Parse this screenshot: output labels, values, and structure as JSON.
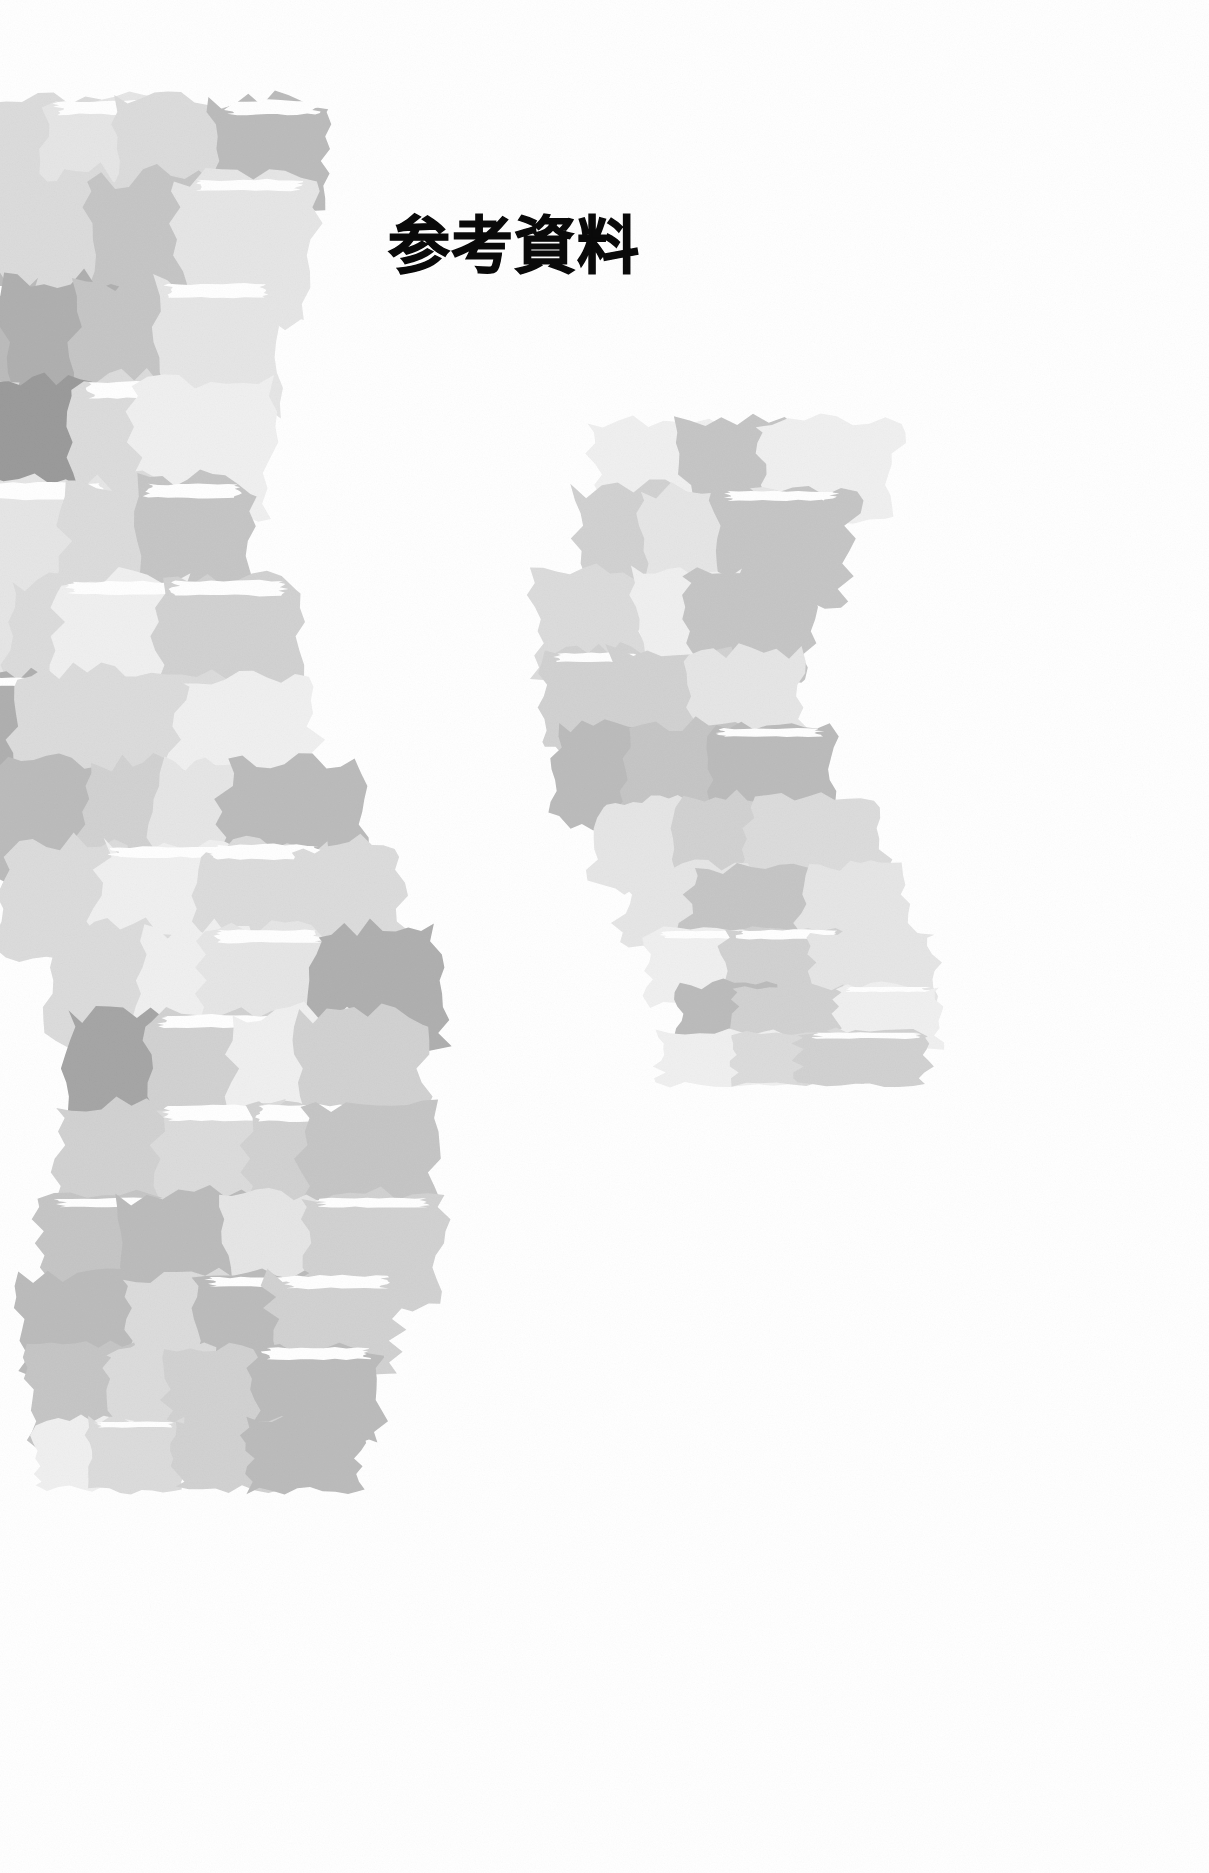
{
  "page": {
    "background_color": "#ffffff",
    "width": 1209,
    "height": 1873,
    "kind": "section-divider-page"
  },
  "title": {
    "text": "参考資料",
    "translation_hint": "Reference Materials",
    "color": "#0a0a0a",
    "weight": "bold",
    "x": 388,
    "y": 216
  },
  "artwork": {
    "name": "torn-paper-collage-ribbons",
    "description": "Two sinuous S-curved ribbons built from overlapping torn paper fragments in neutral grays on a white ground.",
    "palette": [
      "#9b9b9b",
      "#a6a6a6",
      "#b0b0b0",
      "#bcbcbc",
      "#c6c6c6",
      "#d2d2d2",
      "#dcdcdc",
      "#e6e6e6",
      "#f0f0f0",
      "#ffffff"
    ],
    "ribbons": [
      {
        "id": "ribbon-left",
        "label": "large-left-ribbon",
        "bbox": [
          60,
          112,
          500,
          1392
        ],
        "columns": 4,
        "rows": 16,
        "spine": [
          [
            150,
            115
          ],
          [
            110,
            300
          ],
          [
            80,
            500
          ],
          [
            110,
            690
          ],
          [
            190,
            860
          ],
          [
            250,
            1030
          ],
          [
            250,
            1210
          ],
          [
            200,
            1360
          ],
          [
            185,
            1480
          ]
        ],
        "width_profile": [
          330,
          320,
          330,
          345,
          350,
          330,
          320,
          320,
          300
        ]
      },
      {
        "id": "ribbon-right",
        "label": "small-right-ribbon",
        "bbox": [
          628,
          430,
          315,
          650
        ],
        "columns": 3,
        "rows": 10,
        "spine": [
          [
            760,
            435
          ],
          [
            700,
            560
          ],
          [
            660,
            690
          ],
          [
            700,
            810
          ],
          [
            780,
            920
          ],
          [
            800,
            1010
          ],
          [
            790,
            1075
          ]
        ],
        "width_profile": [
          235,
          225,
          230,
          240,
          245,
          235,
          225
        ]
      }
    ]
  }
}
